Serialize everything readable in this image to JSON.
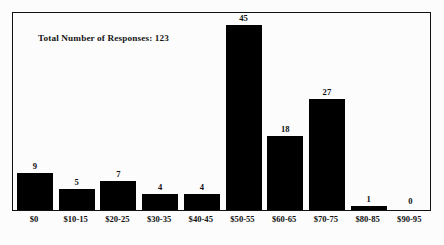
{
  "chart_data": {
    "type": "bar",
    "title": "Total Number of Responses: 123",
    "xlabel": "",
    "ylabel": "",
    "grid": false,
    "legend": "none",
    "ylim": [
      0,
      48
    ],
    "categories": [
      "$0",
      "$10-15",
      "$20-25",
      "$30-35",
      "$40-45",
      "$50-55",
      "$60-65",
      "$70-75",
      "$80-85",
      "$90-95"
    ],
    "values": [
      9,
      5,
      7,
      4,
      4,
      45,
      18,
      27,
      1,
      0
    ],
    "data_labels": [
      "9",
      "5",
      "7",
      "4",
      "4",
      "45",
      "18",
      "27",
      "1",
      "0"
    ],
    "annotations": [
      "Total Number of Responses: 123"
    ],
    "total_responses": 123,
    "bar_color": "#000000",
    "background_color": "#fcfcfc",
    "frame_color": "#111111"
  }
}
